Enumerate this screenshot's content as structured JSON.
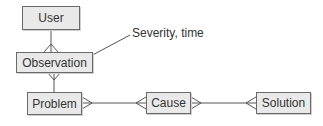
{
  "diagram": {
    "type": "entity-relationship",
    "entities": [
      {
        "id": "user",
        "label": "User"
      },
      {
        "id": "observation",
        "label": "Observation"
      },
      {
        "id": "problem",
        "label": "Problem"
      },
      {
        "id": "cause",
        "label": "Cause"
      },
      {
        "id": "solution",
        "label": "Solution"
      }
    ],
    "annotation": {
      "label": "Severity, time",
      "attached_to": "observation"
    },
    "relationships": [
      {
        "from": "user",
        "to": "observation",
        "from_cardinality": "one",
        "to_cardinality": "many"
      },
      {
        "from": "observation",
        "to": "problem",
        "from_cardinality": "many",
        "to_cardinality": "one"
      },
      {
        "from": "problem",
        "to": "cause",
        "from_cardinality": "many",
        "to_cardinality": "many"
      },
      {
        "from": "cause",
        "to": "solution",
        "from_cardinality": "many",
        "to_cardinality": "many"
      }
    ],
    "colors": {
      "entity_fill": "#e9e9e9",
      "entity_border": "#6a6a6a",
      "line": "#555555",
      "text": "#333333"
    }
  }
}
